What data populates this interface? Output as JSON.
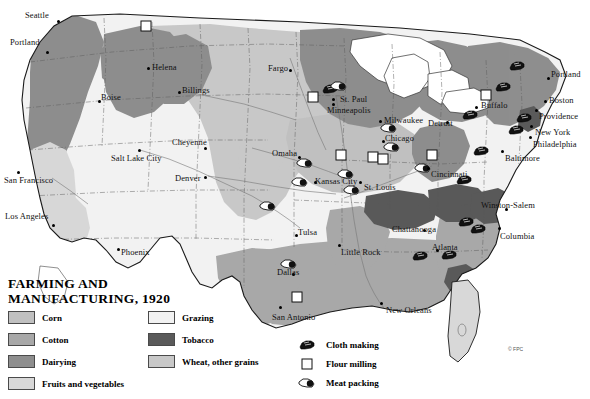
{
  "title": {
    "line1": "FARMING AND",
    "line2": "MANUFACTURING, 1920"
  },
  "copyright": "© FPC",
  "colors": {
    "corn": "#c0c0c0",
    "cotton": "#a8a8a8",
    "dairying": "#8e8e8e",
    "fruits_and_vegetables": "#d8d8d8",
    "grazing": "#f2f2f2",
    "tobacco": "#5a5a5a",
    "wheat_other_grains": "#c8c8c8",
    "water": "#ffffff",
    "outline": "#222222",
    "state_border": "#555555"
  },
  "area_legend": [
    {
      "label": "Corn",
      "color": "#c0c0c0",
      "col": 0,
      "row": 0
    },
    {
      "label": "Cotton",
      "color": "#a8a8a8",
      "col": 0,
      "row": 1
    },
    {
      "label": "Dairying",
      "color": "#8e8e8e",
      "col": 0,
      "row": 2
    },
    {
      "label": "Fruits and vegetables",
      "color": "#d8d8d8",
      "col": 0,
      "row": 3
    },
    {
      "label": "Grazing",
      "color": "#f2f2f2",
      "col": 1,
      "row": 0
    },
    {
      "label": "Tobacco",
      "color": "#5a5a5a",
      "col": 1,
      "row": 1
    },
    {
      "label": "Wheat, other grains",
      "color": "#c8c8c8",
      "col": 1,
      "row": 2
    }
  ],
  "symbol_legend": [
    {
      "label": "Cloth making",
      "icon": "cloth-making-icon"
    },
    {
      "label": "Flour milling",
      "icon": "flour-milling-icon"
    },
    {
      "label": "Meat packing",
      "icon": "meat-packing-icon"
    }
  ],
  "cities": [
    {
      "name": "Seattle",
      "lx": 25,
      "ly": 11,
      "dx": 58,
      "dy": 21,
      "anchor": "right"
    },
    {
      "name": "Portland",
      "lx": 10,
      "ly": 38,
      "dx": 47,
      "dy": 52,
      "anchor": "right"
    },
    {
      "name": "Helena",
      "lx": 152,
      "ly": 63,
      "dx": 148,
      "dy": 68,
      "anchor": "left"
    },
    {
      "name": "Boise",
      "lx": 101,
      "ly": 93,
      "dx": 99,
      "dy": 101,
      "anchor": "left"
    },
    {
      "name": "Billings",
      "lx": 182,
      "ly": 86,
      "dx": 179,
      "dy": 92,
      "anchor": "left"
    },
    {
      "name": "Fargo",
      "lx": 268,
      "ly": 64,
      "dx": 290,
      "dy": 70,
      "anchor": "left"
    },
    {
      "name": "Cheyenne",
      "lx": 172,
      "ly": 138,
      "dx": 205,
      "dy": 148,
      "anchor": "left"
    },
    {
      "name": "Salt Lake City",
      "lx": 111,
      "ly": 154,
      "dx": 139,
      "dy": 150,
      "anchor": "left"
    },
    {
      "name": "Denver",
      "lx": 175,
      "ly": 174,
      "dx": 205,
      "dy": 177,
      "anchor": "left"
    },
    {
      "name": "San Francisco",
      "lx": 4,
      "ly": 176,
      "dx": 18,
      "dy": 172,
      "anchor": "left"
    },
    {
      "name": "Los Angeles",
      "lx": 5,
      "ly": 212,
      "dx": 53,
      "dy": 225,
      "anchor": "left"
    },
    {
      "name": "Phoenix",
      "lx": 121,
      "ly": 248,
      "dx": 118,
      "dy": 249,
      "anchor": "left"
    },
    {
      "name": "Omaha",
      "lx": 272,
      "ly": 149,
      "dx": 299,
      "dy": 157,
      "anchor": "left"
    },
    {
      "name": "Kansas City",
      "lx": 315,
      "ly": 177,
      "dx": 315,
      "dy": 182,
      "anchor": "left"
    },
    {
      "name": "St. Louis",
      "lx": 364,
      "ly": 183,
      "dx": 360,
      "dy": 182,
      "anchor": "left"
    },
    {
      "name": "St. Paul",
      "lx": 340,
      "ly": 95,
      "dx": 333,
      "dy": 99,
      "anchor": "left"
    },
    {
      "name": "Minneapolis",
      "lx": 327,
      "ly": 106,
      "dx": 333,
      "dy": 104,
      "anchor": "left"
    },
    {
      "name": "Milwaukee",
      "lx": 384,
      "ly": 116,
      "dx": 380,
      "dy": 121,
      "anchor": "left"
    },
    {
      "name": "Chicago",
      "lx": 385,
      "ly": 134,
      "dx": 383,
      "dy": 141,
      "anchor": "left"
    },
    {
      "name": "Detroit",
      "lx": 428,
      "ly": 119,
      "dx": 447,
      "dy": 122,
      "anchor": "left"
    },
    {
      "name": "Buffalo",
      "lx": 481,
      "ly": 101,
      "dx": 476,
      "dy": 107,
      "anchor": "left"
    },
    {
      "name": "Cincinnati",
      "lx": 431,
      "ly": 170,
      "dx": 428,
      "dy": 168,
      "anchor": "left"
    },
    {
      "name": "Tulsa",
      "lx": 298,
      "ly": 228,
      "dx": 296,
      "dy": 235,
      "anchor": "left"
    },
    {
      "name": "Little Rock",
      "lx": 341,
      "ly": 248,
      "dx": 339,
      "dy": 245,
      "anchor": "left"
    },
    {
      "name": "Chattanooga",
      "lx": 392,
      "ly": 225,
      "dx": 424,
      "dy": 230,
      "anchor": "left"
    },
    {
      "name": "Atlanta",
      "lx": 432,
      "ly": 243,
      "dx": 437,
      "dy": 250,
      "anchor": "left"
    },
    {
      "name": "Columbia",
      "lx": 500,
      "ly": 232,
      "dx": 499,
      "dy": 228,
      "anchor": "left"
    },
    {
      "name": "Winston-Salem",
      "lx": 481,
      "ly": 201,
      "dx": 506,
      "dy": 209,
      "anchor": "left"
    },
    {
      "name": "Baltimore",
      "lx": 505,
      "ly": 154,
      "dx": 502,
      "dy": 151,
      "anchor": "left"
    },
    {
      "name": "Philadelphia",
      "lx": 533,
      "ly": 140,
      "dx": 530,
      "dy": 137,
      "anchor": "left"
    },
    {
      "name": "New York",
      "lx": 535,
      "ly": 128,
      "dx": 531,
      "dy": 126,
      "anchor": "left"
    },
    {
      "name": "Providence",
      "lx": 539,
      "ly": 112,
      "dx": 536,
      "dy": 110,
      "anchor": "left"
    },
    {
      "name": "Boston",
      "lx": 549,
      "ly": 96,
      "dx": 545,
      "dy": 101,
      "anchor": "left"
    },
    {
      "name": "Portland",
      "lx": 551,
      "ly": 70,
      "dx": 548,
      "dy": 78,
      "anchor": "left"
    },
    {
      "name": "Dallas",
      "lx": 277,
      "ly": 268,
      "dx": 293,
      "dy": 274,
      "anchor": "left"
    },
    {
      "name": "San Antonio",
      "lx": 272,
      "ly": 313,
      "dx": 280,
      "dy": 307,
      "anchor": "left"
    },
    {
      "name": "New Orleans",
      "lx": 386,
      "ly": 306,
      "dx": 381,
      "dy": 303,
      "anchor": "left"
    }
  ],
  "industry_markers": [
    {
      "type": "cloth-making-icon",
      "x": 330,
      "y": 89
    },
    {
      "type": "cloth-making-icon",
      "x": 470,
      "y": 115
    },
    {
      "type": "cloth-making-icon",
      "x": 503,
      "y": 87
    },
    {
      "type": "cloth-making-icon",
      "x": 517,
      "y": 66
    },
    {
      "type": "cloth-making-icon",
      "x": 524,
      "y": 118
    },
    {
      "type": "cloth-making-icon",
      "x": 516,
      "y": 130
    },
    {
      "type": "cloth-making-icon",
      "x": 481,
      "y": 151
    },
    {
      "type": "cloth-making-icon",
      "x": 466,
      "y": 222
    },
    {
      "type": "cloth-making-icon",
      "x": 478,
      "y": 229
    },
    {
      "type": "cloth-making-icon",
      "x": 420,
      "y": 256
    },
    {
      "type": "cloth-making-icon",
      "x": 449,
      "y": 255
    },
    {
      "type": "cloth-making-icon",
      "x": 464,
      "y": 180
    },
    {
      "type": "flour-milling-icon",
      "x": 313,
      "y": 97
    },
    {
      "type": "flour-milling-icon",
      "x": 341,
      "y": 155
    },
    {
      "type": "flour-milling-icon",
      "x": 373,
      "y": 157
    },
    {
      "type": "flour-milling-icon",
      "x": 383,
      "y": 159
    },
    {
      "type": "flour-milling-icon",
      "x": 432,
      "y": 155
    },
    {
      "type": "flour-milling-icon",
      "x": 486,
      "y": 95
    },
    {
      "type": "flour-milling-icon",
      "x": 146,
      "y": 26
    },
    {
      "type": "flour-milling-icon",
      "x": 297,
      "y": 297
    },
    {
      "type": "meat-packing-icon",
      "x": 268,
      "y": 206
    },
    {
      "type": "meat-packing-icon",
      "x": 305,
      "y": 163
    },
    {
      "type": "meat-packing-icon",
      "x": 300,
      "y": 182
    },
    {
      "type": "meat-packing-icon",
      "x": 352,
      "y": 190
    },
    {
      "type": "meat-packing-icon",
      "x": 289,
      "y": 264
    },
    {
      "type": "meat-packing-icon",
      "x": 346,
      "y": 174
    },
    {
      "type": "meat-packing-icon",
      "x": 389,
      "y": 128
    },
    {
      "type": "meat-packing-icon",
      "x": 392,
      "y": 147
    },
    {
      "type": "meat-packing-icon",
      "x": 423,
      "y": 168
    },
    {
      "type": "meat-packing-icon",
      "x": 339,
      "y": 86
    }
  ]
}
